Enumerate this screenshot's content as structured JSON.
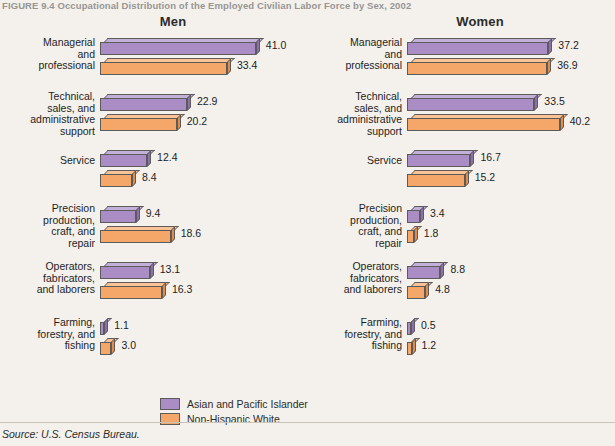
{
  "figure": {
    "title": "FIGURE 9.4  Occupational Distribution of the Employed Civilian Labor Force by Sex, 2002",
    "source": "Source: U.S. Census Bureau."
  },
  "legend": {
    "items": [
      {
        "label": "Asian and Pacific Islander",
        "color": "#a98dc4"
      },
      {
        "label": "Non-Hispanic White",
        "color": "#f5a76a"
      }
    ]
  },
  "panels": [
    {
      "key": "men",
      "title": "Men"
    },
    {
      "key": "women",
      "title": "Women"
    }
  ],
  "chart_data": {
    "type": "bar",
    "title": "FIGURE 9.4  Occupational Distribution of the Employed Civilian Labor Force by Sex, 2002",
    "xlabel": "",
    "ylabel": "",
    "orientation": "horizontal",
    "grid": false,
    "legend_position": "bottom-center",
    "value_suffix": "",
    "xlim": [
      0,
      42
    ],
    "categories": [
      "Managerial and professional",
      "Technical, sales, and administrative support",
      "Service",
      "Precision production, craft, and repair",
      "Operators, fabricators, and laborers",
      "Farming, forestry, and fishing"
    ],
    "panels": [
      {
        "name": "Men",
        "series": [
          {
            "name": "Asian and Pacific Islander",
            "color": "#a98dc4",
            "values": [
              41.0,
              22.9,
              12.4,
              9.4,
              13.1,
              1.1
            ]
          },
          {
            "name": "Non-Hispanic White",
            "color": "#f5a76a",
            "values": [
              33.4,
              20.2,
              8.4,
              18.6,
              16.3,
              3.0
            ]
          }
        ]
      },
      {
        "name": "Women",
        "series": [
          {
            "name": "Asian and Pacific Islander",
            "color": "#a98dc4",
            "values": [
              37.2,
              33.5,
              16.7,
              3.4,
              8.8,
              0.5
            ]
          },
          {
            "name": "Non-Hispanic White",
            "color": "#f5a76a",
            "values": [
              36.9,
              40.2,
              15.2,
              1.8,
              4.8,
              1.2
            ]
          }
        ]
      }
    ]
  }
}
